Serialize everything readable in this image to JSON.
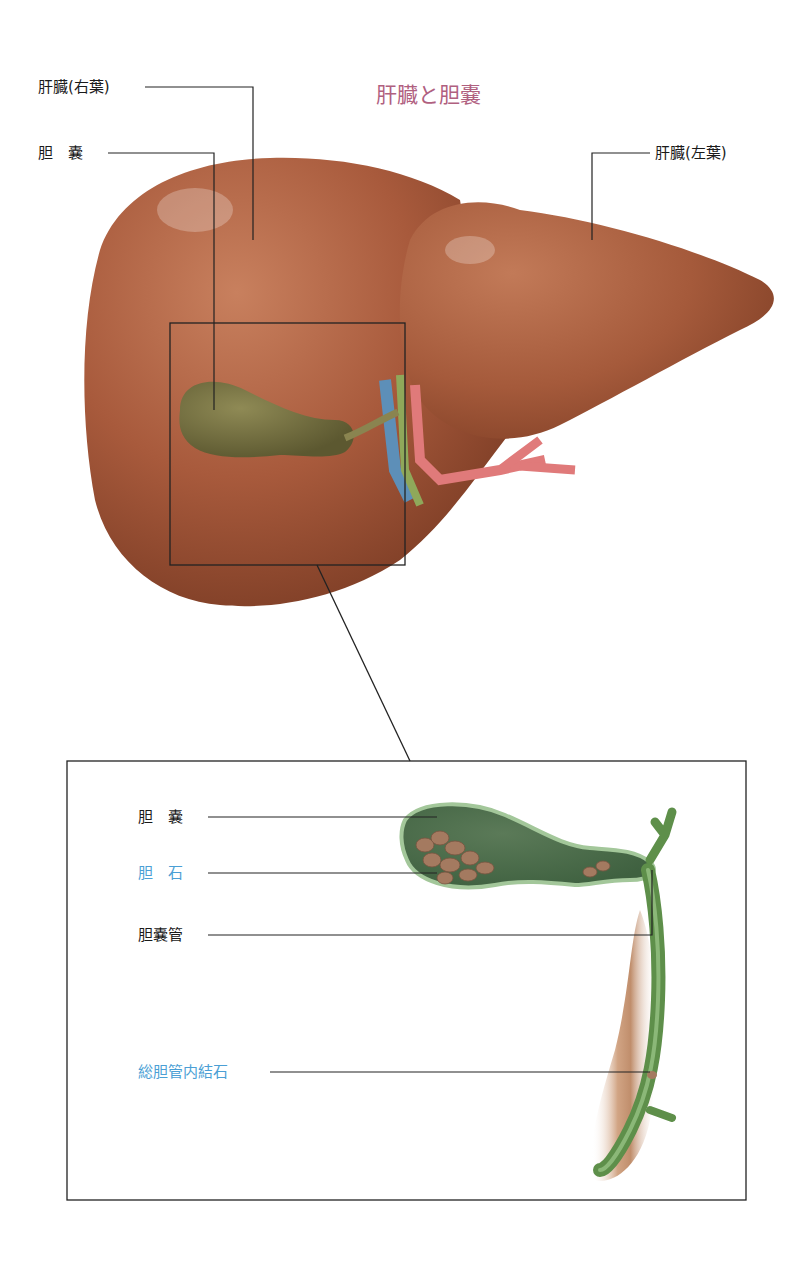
{
  "title": "肝臓と胆嚢",
  "colors": {
    "title": "#b0607f",
    "label_default": "#1a1a1a",
    "label_highlight": "#4b9fd5",
    "liver": "#a85a3c",
    "gallbladder": "#6e6a3a",
    "bile_duct_green": "#5e8f4a",
    "artery": "#e07a7a",
    "vein": "#5d8fb8",
    "callout_line": "#222222"
  },
  "liver_view": {
    "labels": [
      {
        "id": "liver-right-lobe",
        "text": "肝臓(右葉)"
      },
      {
        "id": "gallbladder",
        "text": "胆　嚢"
      },
      {
        "id": "liver-left-lobe",
        "text": "肝臓(左葉)"
      }
    ]
  },
  "inset_view": {
    "labels": [
      {
        "id": "gallbladder",
        "text": "胆　嚢",
        "highlight": false
      },
      {
        "id": "gallstones",
        "text": "胆　石",
        "highlight": true
      },
      {
        "id": "cystic-duct",
        "text": "胆嚢管",
        "highlight": false
      },
      {
        "id": "common-bile-duct-stone",
        "text": "総胆管内結石",
        "highlight": true
      }
    ]
  }
}
